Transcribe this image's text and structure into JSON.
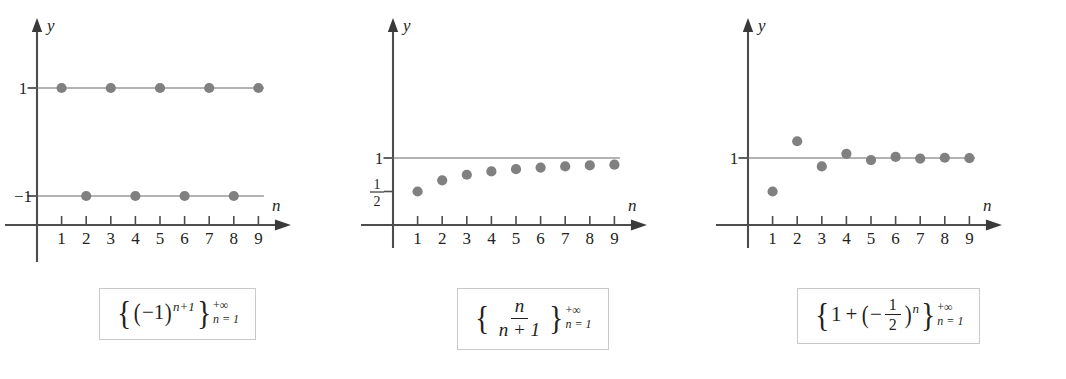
{
  "figure": {
    "background": "#ffffff",
    "dot_color": "#808080",
    "axis_color": "#4d4d4d",
    "level_line_color": "#9a9a9a",
    "caption_border_color": "#c9c9c9"
  },
  "panels": [
    {
      "id": "panel-alternating",
      "caption_text": "{(-1)^(n+1)}  n = 1 to +infinity",
      "caption": {
        "brace_left": "{",
        "brace_right": "}",
        "base_open": "(",
        "minus_one": "−1",
        "base_close": ")",
        "exponent": "n+1",
        "limit_top": "+∞",
        "limit_bottom": "n = 1"
      },
      "chart_data": {
        "type": "scatter",
        "title": "{(-1)^(n+1)} from n = 1 to +∞",
        "xlabel": "n",
        "ylabel": "y",
        "x": [
          1,
          2,
          3,
          4,
          5,
          6,
          7,
          8,
          9
        ],
        "values": [
          1,
          -1,
          1,
          -1,
          1,
          -1,
          1,
          -1,
          1
        ],
        "xticklabels": [
          "1",
          "2",
          "3",
          "4",
          "5",
          "6",
          "7",
          "8",
          "9"
        ],
        "yticklabels": [
          "1",
          "−1"
        ],
        "ytickvalues": [
          1,
          -1
        ],
        "reference_lines": [
          1,
          -1
        ],
        "xlim": [
          0,
          10.2
        ],
        "ylim": [
          -1.85,
          1.85
        ],
        "grid": false,
        "legend": false
      }
    },
    {
      "id": "panel-n-over-n-plus-1",
      "caption_text": "{n/(n+1)}  n = 1 to +infinity",
      "caption": {
        "brace_left": "{",
        "brace_right": "}",
        "numerator": "n",
        "denominator": "n + 1",
        "limit_top": "+∞",
        "limit_bottom": "n = 1"
      },
      "chart_data": {
        "type": "scatter",
        "title": "{n/(n+1)} from n = 1 to +∞",
        "xlabel": "n",
        "ylabel": "y",
        "x": [
          1,
          2,
          3,
          4,
          5,
          6,
          7,
          8,
          9
        ],
        "values": [
          0.5,
          0.667,
          0.75,
          0.8,
          0.833,
          0.857,
          0.875,
          0.889,
          0.9
        ],
        "xticklabels": [
          "1",
          "2",
          "3",
          "4",
          "5",
          "6",
          "7",
          "8",
          "9"
        ],
        "yticklabels": [
          "1",
          "1/2"
        ],
        "ytickvalues": [
          1,
          0.5
        ],
        "reference_lines": [
          1
        ],
        "xlim": [
          0,
          10.2
        ],
        "ylim": [
          0,
          1.85
        ],
        "grid": false,
        "legend": false
      }
    },
    {
      "id": "panel-one-plus-half-alternating",
      "caption_text": "{1 + (-1/2)^n}  n = 1 to +infinity",
      "caption": {
        "brace_left": "{",
        "brace_right": "}",
        "lead": "1",
        "plus": "+",
        "paren_open": "(",
        "sign": "−",
        "frac_num": "1",
        "frac_den": "2",
        "paren_close": ")",
        "exponent": "n",
        "limit_top": "+∞",
        "limit_bottom": "n = 1"
      },
      "chart_data": {
        "type": "scatter",
        "title": "{1 + (−1/2)^n} from n = 1 to +∞",
        "xlabel": "n",
        "ylabel": "y",
        "x": [
          1,
          2,
          3,
          4,
          5,
          6,
          7,
          8,
          9
        ],
        "values": [
          0.5,
          1.25,
          0.875,
          1.0625,
          0.969,
          1.016,
          0.992,
          1.004,
          0.998
        ],
        "xticklabels": [
          "1",
          "2",
          "3",
          "4",
          "5",
          "6",
          "7",
          "8",
          "9"
        ],
        "yticklabels": [
          "1"
        ],
        "ytickvalues": [
          1
        ],
        "reference_lines": [
          1
        ],
        "xlim": [
          0,
          10.2
        ],
        "ylim": [
          0,
          2.1
        ],
        "grid": false,
        "legend": false
      }
    }
  ]
}
